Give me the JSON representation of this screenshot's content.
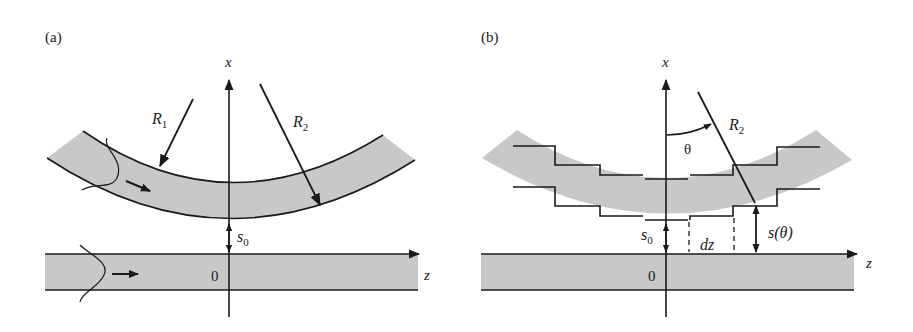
{
  "figure": {
    "panels": [
      {
        "id": "a",
        "label": "(a)",
        "axis_x_label": "x",
        "axis_z_label": "z",
        "origin_label": "0",
        "r1_label": "R",
        "r1_sub": "1",
        "r2_label": "R",
        "r2_sub": "2",
        "gap_label": "s",
        "gap_sub": "0"
      },
      {
        "id": "b",
        "label": "(b)",
        "axis_x_label": "x",
        "axis_z_label": "z",
        "origin_label": "0",
        "r2_label": "R",
        "r2_sub": "2",
        "angle_label": "θ",
        "gap_label": "s",
        "gap_sub": "0",
        "local_gap_label": "s(θ)",
        "dz_label": "dz"
      }
    ],
    "colors": {
      "waveguide_fill": "#c8c8c8",
      "line": "#1a1a1a",
      "background": "#ffffff"
    }
  }
}
